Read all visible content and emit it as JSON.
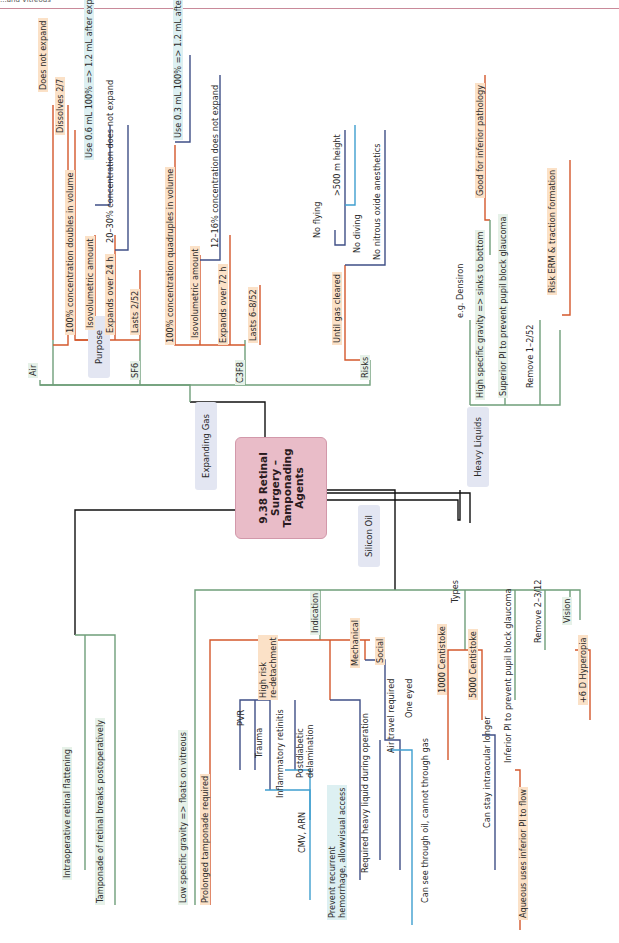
{
  "header": {
    "text": "...and Vitreous"
  },
  "center": {
    "title": "9.38 Retinal\nSurgery –\nTamponading\nAgents"
  },
  "categories": {
    "purpose": "Purpose",
    "expanding_gas": "Expanding Gas",
    "silicon_oil": "Silicon Oil",
    "heavy_liquids": "Heavy Liquids"
  },
  "purpose": {
    "items": [
      "Intraoperative retinal flattening",
      "Tamponade of retinal breaks postoperatively"
    ]
  },
  "expanding_gas": {
    "air": {
      "label": "Air",
      "items": [
        "Does not expand",
        "Dissolves 2/7"
      ]
    },
    "sf6": {
      "label": "SF6",
      "items": [
        "100% concentration doubles in volume",
        "Isovolumetric amount",
        "Expands over 24 h",
        "Lasts 2/52"
      ],
      "doubles_note": "Use 0.6 mL 100% => 1.2 mL after expansion",
      "iso_note": "20–30% concentration does not expand"
    },
    "c3f8": {
      "label": "C3F8",
      "items": [
        "100% concentration quadruples in volume",
        "Isovolumetric amount",
        "Expands over 72 h",
        "Lasts 6–8/52"
      ],
      "quad_note": "Use 0.3 mL 100% => 1.2 mL after expansion",
      "iso_note": "12–16% concentration does not expand"
    },
    "risks": {
      "label": "Risks",
      "until": "Until gas cleared",
      "items": [
        "No flying",
        "No diving",
        "No nitrous oxide anesthetics"
      ],
      "flying_note": ">500 m height"
    }
  },
  "heavy_liquids": {
    "items": [
      "e.g. Densiron",
      "High specific gravity => sinks to bottom",
      "Superior PI to prevent pupil block glaucoma",
      "Remove 1–2/52"
    ],
    "good_for": "Good for inferior pathology",
    "risk": "Risk ERM & traction formation"
  },
  "silicon_oil": {
    "low_sg": "Low specific gravity => floats on vitreous",
    "indication": {
      "label": "Indication",
      "prolonged": "Prolonged tamponade required",
      "high_risk": "High risk\nre-detachment",
      "high_risk_items": [
        "PVR",
        "Trauma",
        "Inflammatory retinitis",
        "Postdiabetic\ndelamination"
      ],
      "cmv": "CMV, ARN",
      "prevent": "Prevent recurrent\nhemorrhage, allowvisual access",
      "mechanical": "Mechanical",
      "mechanical_item": "Required heavy liquid during operation",
      "social": "Social",
      "social_items": [
        "Air travel required",
        "One eyed"
      ],
      "one_eyed_note": "Can see through oil, cannot through gas"
    },
    "types": {
      "label": "Types",
      "items": [
        "1000 Centistoke",
        "5000 Centistoke"
      ],
      "note": "Can stay intraocular longer"
    },
    "inferior_pi": "Inferior PI to prevent pupil block glaucoma",
    "aqueous": "Aqueous uses inferior PI to flow",
    "remove": "Remove 2–3/12",
    "vision": {
      "label": "Vision",
      "item": "+6 D Hyperopia"
    }
  },
  "colors": {
    "green": "#6f9e7a",
    "orange": "#d4582c",
    "navy": "#3f4f86",
    "blue": "#3f9fcf",
    "black": "#111111"
  }
}
